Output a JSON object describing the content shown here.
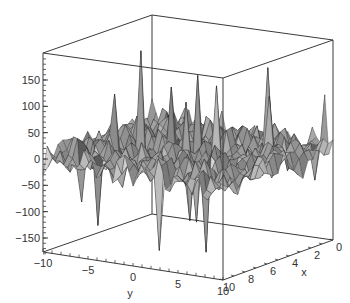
{
  "chart_data": {
    "type": "surface3d",
    "title": "",
    "style": "wireframe-shaded surface in a boxed 3D frame (grayscale)",
    "xlabel": "x",
    "ylabel": "y",
    "zlabel": "",
    "x_ticks": [
      "0",
      "2",
      "4",
      "6",
      "8",
      "10"
    ],
    "y_ticks": [
      "-10",
      "-5",
      "0",
      "5",
      "10"
    ],
    "z_ticks": [
      "150",
      "100",
      "50",
      "0",
      "-50",
      "-100",
      "-150"
    ],
    "xlim": [
      0,
      10
    ],
    "ylim": [
      -10,
      10
    ],
    "zlim": [
      -180,
      190
    ],
    "grid": false,
    "legend": null,
    "surface_description": "Highly oscillatory noisy surface centered near z=0 with sharp positive spikes (up to ~190) and negative spikes (down to ~-160)",
    "notable_peaks": [
      {
        "y_approx": -4,
        "x_approx": 6,
        "z": 190
      },
      {
        "y_approx": 0,
        "x_approx": 4,
        "z": 140
      },
      {
        "y_approx": 5,
        "x_approx": 2,
        "z": 150
      },
      {
        "y_approx": 3,
        "x_approx": 5,
        "z": 135
      },
      {
        "y_approx": 9,
        "x_approx": 0,
        "z": 95
      }
    ],
    "notable_troughs": [
      {
        "y_approx": -5,
        "x_approx": 9,
        "z": -120
      },
      {
        "y_approx": 2,
        "x_approx": 9,
        "z": -150
      },
      {
        "y_approx": 6,
        "x_approx": 8,
        "z": -150
      },
      {
        "y_approx": 3,
        "x_approx": 7,
        "z": -110
      }
    ]
  },
  "labels": {
    "x_axis": "x",
    "y_axis": "y",
    "x_ticks": [
      "0",
      "2",
      "4",
      "6",
      "8",
      "10"
    ],
    "y_ticks": [
      "-10",
      "-5",
      "0",
      "5",
      "10"
    ],
    "z_ticks": [
      "150",
      "100",
      "50",
      "0",
      "-50",
      "-100",
      "-150"
    ]
  },
  "colors": {
    "frame": "#3a3a3a",
    "surface_fill": "#9a9a9a",
    "surface_line": "#1a1a1a",
    "text": "#333333"
  }
}
